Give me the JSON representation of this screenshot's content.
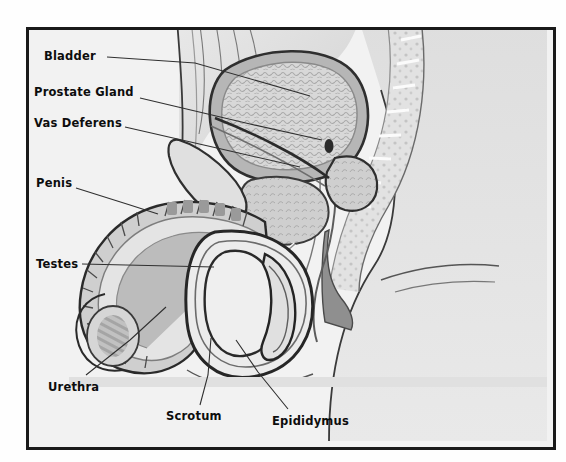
{
  "diagram": {
    "type": "anatomical-illustration",
    "style": "grayscale medical cross-section with bold leader-line labels",
    "frame": {
      "border_color": "#1a1a1a",
      "background_color": "#f2f2f2"
    },
    "palette": {
      "background": "#f2f2f2",
      "skin_light": "#e3e3e3",
      "tissue_mid": "#c9c9c9",
      "tissue_dark": "#a8a8a8",
      "muscle_dark": "#8d8d8d",
      "outline": "#2b2b2b",
      "highlight": "#f7f7f7",
      "label_text": "#0d0d0d",
      "leader_line": "#303030"
    },
    "labels": [
      {
        "id": "bladder",
        "text": "Bladder",
        "x": 44,
        "y": 51,
        "leader": [
          [
            107,
            57
          ],
          [
            195,
            63
          ],
          [
            310,
            96
          ]
        ]
      },
      {
        "id": "prostate-gland",
        "text": "Prostate Gland",
        "x": 34,
        "y": 87,
        "leader": [
          [
            140,
            98
          ],
          [
            250,
            124
          ],
          [
            322,
            140
          ]
        ]
      },
      {
        "id": "vas-deferens",
        "text": "Vas Deferens",
        "x": 34,
        "y": 118,
        "leader": [
          [
            125,
            127
          ],
          [
            230,
            151
          ],
          [
            300,
            167
          ]
        ]
      },
      {
        "id": "penis",
        "text": "Penis",
        "x": 36,
        "y": 178,
        "leader": [
          [
            76,
            188
          ],
          [
            130,
            205
          ],
          [
            158,
            214
          ]
        ]
      },
      {
        "id": "testes",
        "text": "Testes",
        "x": 36,
        "y": 259,
        "leader": [
          [
            82,
            264
          ],
          [
            170,
            266
          ],
          [
            214,
            267
          ]
        ]
      },
      {
        "id": "urethra",
        "text": "Urethra",
        "x": 48,
        "y": 382,
        "leader": [
          [
            86,
            375
          ],
          [
            130,
            340
          ],
          [
            166,
            307
          ]
        ]
      },
      {
        "id": "scrotum",
        "text": "Scrotum",
        "x": 166,
        "y": 411,
        "leader": [
          [
            200,
            405
          ],
          [
            208,
            375
          ],
          [
            211,
            338
          ]
        ]
      },
      {
        "id": "epididymus",
        "text": "Epididymus",
        "x": 272,
        "y": 416,
        "leader": [
          [
            288,
            409
          ],
          [
            258,
            372
          ],
          [
            236,
            340
          ]
        ]
      }
    ],
    "structures": [
      "abdominal wall",
      "urinary bladder",
      "prostate gland",
      "seminal vesicle",
      "vas deferens",
      "penis shaft",
      "glans penis",
      "urethra",
      "scrotum",
      "testis",
      "epididymis",
      "sacrum and vertebrae",
      "rectum",
      "buttock",
      "thigh"
    ]
  }
}
